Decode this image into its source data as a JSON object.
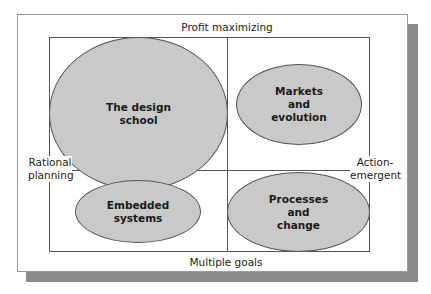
{
  "diagram": {
    "axes": {
      "top": "Profit maximizing",
      "bottom": "Multiple goals",
      "left": "Rational\nplanning",
      "right": "Action-\nemergent"
    },
    "quadrants": [
      {
        "position": "top-left",
        "label": "The design\nschool"
      },
      {
        "position": "top-right",
        "label": "Markets\nand\nevolution"
      },
      {
        "position": "bottom-left",
        "label": "Embedded\nsystems"
      },
      {
        "position": "bottom-right",
        "label": "Processes\nand\nchange"
      }
    ],
    "colors": {
      "ellipse_fill": "#c9c9c9",
      "shadow": "#8c8c8c",
      "lines": "#555555"
    }
  }
}
